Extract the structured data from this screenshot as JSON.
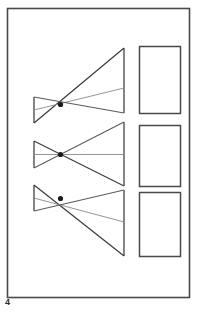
{
  "figure": {
    "label": "4",
    "caption": "",
    "border": {
      "x": 7.5,
      "y": 8.5,
      "width": 182,
      "height": 289,
      "stroke": "#4a4a4a",
      "stroke_width": 1.6,
      "fill": "#ffffff"
    },
    "colors": {
      "background": "#ffffff",
      "line_dark": "#3a3a3a",
      "line_mid": "#5c5c5c",
      "line_light": "#8a8a8a",
      "node": "#1a1a1a",
      "label": "#2b2b2b"
    }
  },
  "diagram": {
    "type": "optical-ray-trace",
    "groups": [
      {
        "name": "group-top",
        "object_plane": {
          "x": 34,
          "y_top": 97,
          "y_bottom": 123,
          "stroke": "#5c5c5c"
        },
        "node": {
          "x": 60.5,
          "y": 104.5,
          "radius": 2.6
        },
        "image_plane": {
          "x": 124,
          "y_top": 48,
          "y_bottom": 113,
          "stroke": "#5c5c5c"
        },
        "rays": [
          {
            "from_y": 123,
            "to_y": 48,
            "weight": "dark"
          },
          {
            "from_y": 110,
            "to_y": 88,
            "weight": "light"
          },
          {
            "from_y": 97,
            "to_y": 113,
            "weight": "mid"
          }
        ]
      },
      {
        "name": "group-middle",
        "object_plane": {
          "x": 34,
          "y_top": 141,
          "y_bottom": 168,
          "stroke": "#5c5c5c"
        },
        "node": {
          "x": 60.5,
          "y": 154.5,
          "radius": 2.6
        },
        "image_plane": {
          "x": 124,
          "y_top": 122,
          "y_bottom": 186,
          "stroke": "#5c5c5c"
        },
        "rays": [
          {
            "from_y": 141,
            "to_y": 186,
            "weight": "dark"
          },
          {
            "from_y": 154.5,
            "to_y": 154.5,
            "weight": "light"
          },
          {
            "from_y": 168,
            "to_y": 122,
            "weight": "mid"
          }
        ]
      },
      {
        "name": "group-bottom",
        "object_plane": {
          "x": 34,
          "y_top": 185,
          "y_bottom": 211,
          "stroke": "#5c5c5c"
        },
        "node": {
          "x": 60.5,
          "y": 198.5,
          "radius": 2.6
        },
        "image_plane": {
          "x": 124,
          "y_top": 190,
          "y_bottom": 256,
          "stroke": "#5c5c5c"
        },
        "rays": [
          {
            "from_y": 185,
            "to_y": 256,
            "weight": "dark"
          },
          {
            "from_y": 198,
            "to_y": 222,
            "weight": "light"
          },
          {
            "from_y": 211,
            "to_y": 190,
            "weight": "mid"
          }
        ]
      }
    ],
    "detector_rectangles": [
      {
        "name": "detector-1",
        "x": 139,
        "y": 46,
        "width": 41,
        "height": 67
      },
      {
        "name": "detector-2",
        "x": 139,
        "y": 125,
        "width": 41,
        "height": 61
      },
      {
        "name": "detector-3",
        "x": 139,
        "y": 192,
        "width": 41,
        "height": 64
      }
    ]
  }
}
